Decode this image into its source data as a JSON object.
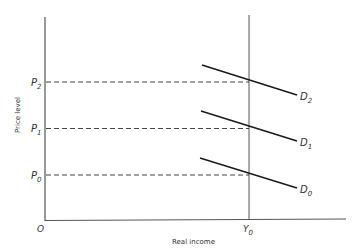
{
  "diagram": {
    "type": "macroeconomic aggregate demand shifts",
    "axes": {
      "y_label": "Price level",
      "x_label": "Real income",
      "origin_label": "O"
    },
    "price_levels": [
      {
        "label": "P",
        "sub": "2",
        "y": 82
      },
      {
        "label": "P",
        "sub": "1",
        "y": 128
      },
      {
        "label": "P",
        "sub": "0",
        "y": 175
      }
    ],
    "income_marker": {
      "label": "Y",
      "sub": "0",
      "x": 249
    },
    "demand_curves": [
      {
        "label": "D",
        "sub": "2",
        "x1": 202,
        "y1": 65,
        "x2": 297,
        "y2": 95
      },
      {
        "label": "D",
        "sub": "1",
        "x1": 201,
        "y1": 111,
        "x2": 297,
        "y2": 141
      },
      {
        "label": "D",
        "sub": "0",
        "x1": 200,
        "y1": 158,
        "x2": 297,
        "y2": 188
      }
    ],
    "colors": {
      "axis": "#555555",
      "curve": "#1a1a1a",
      "dashed": "#444444",
      "text": "#333333"
    }
  }
}
